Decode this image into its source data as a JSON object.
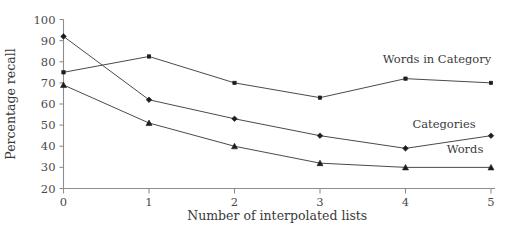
{
  "chart_data": {
    "type": "line",
    "title": "",
    "xlabel": "Number of interpolated lists",
    "ylabel": "Percentage recall",
    "x": [
      0,
      1,
      2,
      3,
      4,
      5
    ],
    "categories": [
      "0",
      "1",
      "2",
      "3",
      "4",
      "5"
    ],
    "xlim": [
      0,
      5
    ],
    "ylim": [
      20,
      100
    ],
    "y_ticks": [
      20,
      30,
      40,
      50,
      60,
      70,
      80,
      90,
      100
    ],
    "y_tick_labels": [
      "20",
      "30",
      "40",
      "50",
      "60",
      "70",
      "80",
      "90",
      "100"
    ],
    "x_ticks": [
      0,
      1,
      2,
      3,
      4,
      5
    ],
    "x_tick_labels": [
      "0",
      "1",
      "2",
      "3",
      "4",
      "5"
    ],
    "grid": false,
    "legend_position": "inline-right-of-series",
    "series": [
      {
        "name": "Words in Category",
        "marker": "square",
        "values": [
          75,
          82.5,
          70,
          63,
          72,
          70
        ]
      },
      {
        "name": "Categories",
        "marker": "diamond",
        "values": [
          92,
          62,
          53,
          45,
          39,
          45
        ]
      },
      {
        "name": "Words",
        "marker": "triangle",
        "values": [
          69,
          51,
          40,
          32,
          30,
          30
        ]
      }
    ],
    "annotations": [
      {
        "text": "Words in Category",
        "series": "Words in Category"
      },
      {
        "text": "Categories",
        "series": "Categories"
      },
      {
        "text": "Words",
        "series": "Words"
      }
    ],
    "colors": {
      "line": "#4a4a4a",
      "marker": "#1d1d1d",
      "axis": "#8d8d8d",
      "text": "#3a3a3a",
      "background": "#ffffff"
    }
  }
}
